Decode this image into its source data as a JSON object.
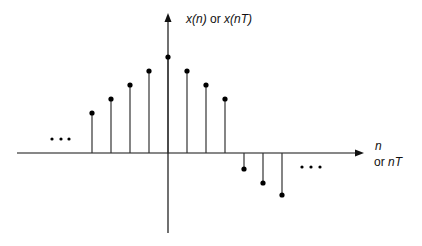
{
  "diagram": {
    "y_axis_label": {
      "p1": "x(",
      "v1": "n",
      "p2": ")",
      "or": " or ",
      "p3": "x(",
      "v3": "nT",
      "p4": ")"
    },
    "x_axis_label": {
      "line1": "n",
      "or": "or ",
      "line2": "nT"
    },
    "ellipsis_left": "...",
    "ellipsis_right": "...",
    "colors": {
      "line": "#111111",
      "stem": "#333333",
      "dot": "#000000"
    }
  },
  "chart_data": {
    "type": "stem",
    "title": "",
    "xlabel": "n or nT",
    "ylabel": "x(n) or x(nT)",
    "x": [
      -4,
      -3,
      -2,
      -1,
      0,
      1,
      2,
      3,
      4,
      5,
      6
    ],
    "values": [
      1.0,
      1.35,
      1.7,
      2.05,
      2.4,
      2.05,
      1.7,
      1.35,
      -0.4,
      -0.75,
      -1.05
    ],
    "annotations": [
      "... (continues left)",
      "... (continues right)"
    ],
    "grid": false,
    "legend": null
  }
}
